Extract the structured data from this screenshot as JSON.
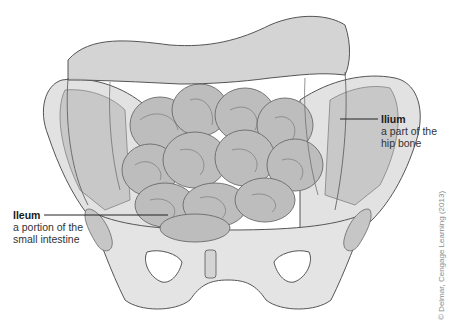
{
  "figure": {
    "colors": {
      "bone_fill": "#e6e6e6",
      "bone_shadow": "#c4c4c4",
      "bone_outline": "#555555",
      "colon_fill": "#cfcfcf",
      "intestine_fill": "#bdbdbd",
      "intestine_outline": "#6a6a6a",
      "leader_line": "#222222"
    }
  },
  "labels": {
    "ilium": {
      "title": "Ilium",
      "line1": "a part of the",
      "line2": "hip bone"
    },
    "ileum": {
      "title": "Ileum",
      "line1": "a portion of the",
      "line2": "small intestine"
    }
  },
  "credit": "© Delmar, Cengage Learning (2013)"
}
